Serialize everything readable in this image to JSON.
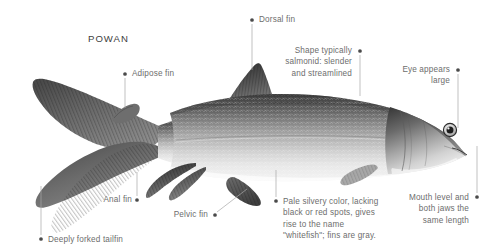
{
  "page": {
    "title": "POWAN",
    "background_color": "#ffffff",
    "text_color": "#6d6d6d",
    "title_color": "#3d3d3d",
    "leader_color": "#a8a8a8",
    "dot_color": "#4a4a4a"
  },
  "callouts": [
    {
      "id": "adipose-fin",
      "text": "Adipose fin",
      "align": "left",
      "text_x": 132,
      "text_y": 68,
      "dot": {
        "x": 125,
        "y": 74
      },
      "leader": {
        "x1": 125,
        "y1": 78,
        "x2": 125,
        "y2": 108
      }
    },
    {
      "id": "dorsal-fin",
      "text": "Dorsal fin",
      "align": "left",
      "text_x": 259,
      "text_y": 14,
      "dot": {
        "x": 252,
        "y": 20
      },
      "leader": {
        "x1": 252,
        "y1": 24,
        "x2": 252,
        "y2": 70
      }
    },
    {
      "id": "shape-salmonid",
      "text": "Shape typically\nsalmonid: slender\nand streamlined",
      "align": "right",
      "text_x": 264,
      "text_y": 45,
      "text_w": 88,
      "dot": {
        "x": 360,
        "y": 51
      },
      "leader": {
        "x1": 360,
        "y1": 55,
        "x2": 360,
        "y2": 96
      }
    },
    {
      "id": "eye-appears-large",
      "text": "Eye appears\nlarge",
      "align": "right",
      "text_x": 386,
      "text_y": 64,
      "text_w": 64,
      "dot": {
        "x": 458,
        "y": 70
      },
      "leader": {
        "x1": 458,
        "y1": 74,
        "x2": 458,
        "y2": 128
      }
    },
    {
      "id": "mouth-level-jaws",
      "text": "Mouth level and\nboth jaws the\nsame length",
      "align": "right",
      "text_x": 403,
      "text_y": 192,
      "text_w": 66,
      "dot": {
        "x": 477,
        "y": 197
      },
      "leader": {
        "x1": 477,
        "y1": 193,
        "x2": 477,
        "y2": 146
      }
    },
    {
      "id": "pale-silvery-color",
      "text": "Pale silvery color, lacking\nblack or red spots, gives\nrise to the name\n\"whitefish\"; fins are gray.",
      "align": "left",
      "text_x": 283,
      "text_y": 196,
      "text_w": 130,
      "dot": {
        "x": 276,
        "y": 201
      },
      "leader": {
        "x1": 276,
        "y1": 197,
        "x2": 276,
        "y2": 170
      }
    },
    {
      "id": "pelvic-fin",
      "text": "Pelvic fin",
      "align": "right",
      "text_x": 167,
      "text_y": 209,
      "text_w": 41,
      "dot": {
        "x": 215,
        "y": 215
      },
      "leader": {
        "x1": 217,
        "y1": 212,
        "x2": 247,
        "y2": 189
      }
    },
    {
      "id": "anal-fin",
      "text": "Anal fin",
      "align": "right",
      "text_x": 96,
      "text_y": 194,
      "text_w": 36,
      "dot": {
        "x": 137,
        "y": 200
      },
      "leader": {
        "x1": 137,
        "y1": 196,
        "x2": 137,
        "y2": 172
      }
    },
    {
      "id": "deeply-forked-tailfin",
      "text": "Deeply forked tailfin",
      "align": "left",
      "text_x": 48,
      "text_y": 234,
      "dot": {
        "x": 41,
        "y": 239
      },
      "leader": {
        "x1": 41,
        "y1": 235,
        "x2": 41,
        "y2": 186
      }
    }
  ],
  "illustration": {
    "name": "powan-whitefish-lateral-view",
    "orientation": "head-right-tail-left",
    "parts": [
      "caudal-fin",
      "adipose-fin",
      "dorsal-fin",
      "anal-fin",
      "pelvic-fin",
      "pectoral-fin",
      "eye",
      "mouth",
      "gill-cover",
      "lateral-line",
      "scales"
    ]
  }
}
